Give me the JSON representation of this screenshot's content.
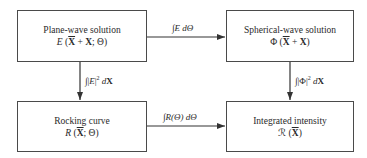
{
  "boxes": {
    "plane_wave": {
      "title": "Plane-wave solution",
      "func": "E",
      "args_pre": " (",
      "xbar": "X",
      "args_mid": " + ",
      "x": "X",
      "args_post": "; Θ)"
    },
    "spherical_wave": {
      "title": "Spherical-wave solution",
      "func": "Φ",
      "args_pre": " (",
      "xbar": "X",
      "args_mid": " + ",
      "x": "X",
      "args_post": ")"
    },
    "rocking_curve": {
      "title": "Rocking curve",
      "func": "R",
      "args_pre": " (",
      "xbar": "X",
      "args_post": "; Θ)"
    },
    "integrated_intensity": {
      "title": "Integrated intensity",
      "func": "ℛ",
      "args_pre": " (",
      "xbar": "X",
      "args_post": ")"
    }
  },
  "arrows": {
    "top": {
      "integral": "∫",
      "body": "E",
      "d": " dΘ"
    },
    "bottom": {
      "integral": "∫",
      "body": "R(Θ)",
      "d": " dΘ"
    },
    "left": {
      "integral": "∫",
      "pre": "|",
      "body": "E",
      "post": "|",
      "power": "2",
      "d": " d",
      "var": "X"
    },
    "right": {
      "integral": "∫",
      "pre": "|",
      "body": "Φ",
      "post": "|",
      "power": "2",
      "d": " d",
      "var": "X"
    }
  }
}
